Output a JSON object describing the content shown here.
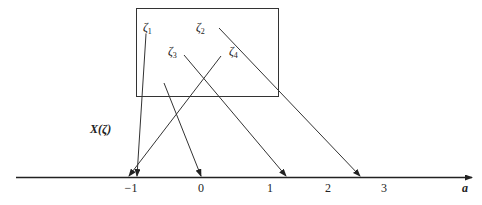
{
  "diagram": {
    "sample_points": [
      {
        "label": "ζ",
        "sub": "1",
        "x": 143,
        "y": 31
      },
      {
        "label": "ζ",
        "sub": "2",
        "x": 196,
        "y": 31
      },
      {
        "label": "ζ",
        "sub": "3",
        "x": 168,
        "y": 55
      },
      {
        "label": "ζ",
        "sub": "4",
        "x": 229,
        "y": 55
      }
    ],
    "mapping_label": "X(ζ)",
    "axis": {
      "label": "a",
      "ticks": [
        {
          "label": "−1",
          "x": 131
        },
        {
          "label": "0",
          "x": 201
        },
        {
          "label": "1",
          "x": 270
        },
        {
          "label": "2",
          "x": 328
        },
        {
          "label": "3",
          "x": 384
        }
      ]
    },
    "arrows": [
      {
        "name": "zeta1-to-minus1",
        "x1": 146,
        "y1": 34,
        "x2": 137,
        "y2": 176
      },
      {
        "name": "zeta2-to-2.5",
        "x1": 219,
        "y1": 28,
        "x2": 360,
        "y2": 176
      },
      {
        "name": "zeta3-to-1.2",
        "x1": 184,
        "y1": 55,
        "x2": 286,
        "y2": 176
      },
      {
        "name": "zeta4-to-minus1",
        "x1": 221,
        "y1": 56,
        "x2": 129,
        "y2": 176
      },
      {
        "name": "point-to-0",
        "x1": 164,
        "y1": 83,
        "x2": 201,
        "y2": 176
      }
    ]
  }
}
